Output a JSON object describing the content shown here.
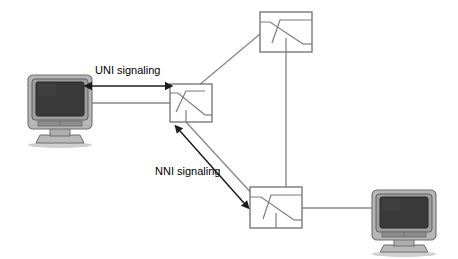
{
  "diagram": {
    "background_color": "#ffffff",
    "labels": {
      "uni": "UNI signaling",
      "nni": "NNI signaling"
    },
    "colors": {
      "line": "#8a8a8a",
      "arrow": "#1c1c1c",
      "node_stroke": "#6f6f6f",
      "node_fill": "#ffffff",
      "monitor_bezel": "#b6b6b6",
      "monitor_screen": "#3a3a3a",
      "text": "#000000"
    },
    "nodes": [
      {
        "id": "monitor-left",
        "type": "monitor",
        "label": "",
        "x": 28,
        "y": 75,
        "width": 62,
        "height": 66
      },
      {
        "id": "switch-center",
        "type": "switch",
        "label": "",
        "x": 170,
        "y": 84,
        "width": 42,
        "height": 38
      },
      {
        "id": "switch-top",
        "type": "switch",
        "label": "",
        "x": 260,
        "y": 12,
        "width": 52,
        "height": 40
      },
      {
        "id": "switch-bottom",
        "type": "switch",
        "label": "",
        "x": 250,
        "y": 187,
        "width": 52,
        "height": 41
      },
      {
        "id": "monitor-right",
        "type": "monitor",
        "label": "",
        "x": 372,
        "y": 190,
        "width": 62,
        "height": 62
      }
    ],
    "edges": [
      {
        "id": "edge-monitor-left-switch-center",
        "from": "monitor-left",
        "to": "switch-center",
        "style": "solid"
      },
      {
        "id": "edge-switch-center-switch-top",
        "from": "switch-center",
        "to": "switch-top",
        "style": "solid"
      },
      {
        "id": "edge-switch-center-switch-bottom",
        "from": "switch-center",
        "to": "switch-bottom",
        "style": "solid"
      },
      {
        "id": "edge-switch-top-switch-bottom",
        "from": "switch-top",
        "to": "switch-bottom",
        "style": "solid"
      },
      {
        "id": "edge-switch-bottom-monitor-right",
        "from": "switch-bottom",
        "to": "monitor-right",
        "style": "solid"
      }
    ],
    "annotations": [
      {
        "id": "uni-annotation",
        "text": "UNI signaling",
        "arrow": "double-headed",
        "orientation": "horizontal",
        "x": 95,
        "y": 72
      },
      {
        "id": "nni-annotation",
        "text": "NNI signaling",
        "arrow": "double-headed",
        "orientation": "diagonal",
        "x": 155,
        "y": 175
      }
    ]
  }
}
